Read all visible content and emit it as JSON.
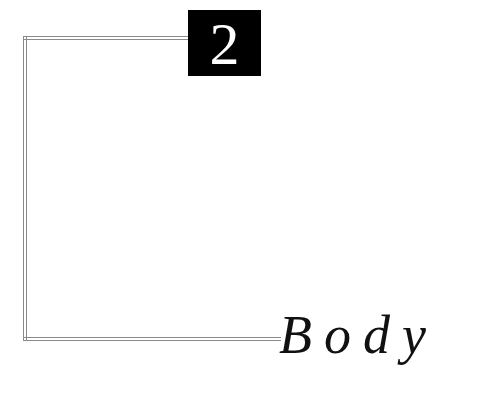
{
  "chapter": {
    "number": "2",
    "title": "Body"
  },
  "colors": {
    "box_background": "#000000",
    "number_color": "#ffffff",
    "title_color": "#111111",
    "frame_line_color": "#8a8a8a"
  }
}
